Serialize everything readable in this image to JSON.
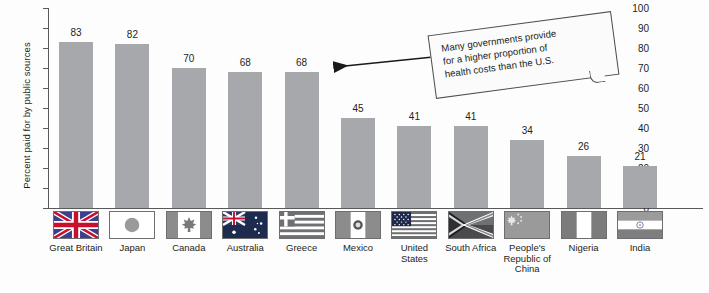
{
  "chart_data": {
    "type": "bar",
    "title": "",
    "xlabel": "",
    "ylabel": "Percent paid for by public sources",
    "ylim": [
      0,
      100
    ],
    "ytick_step": 10,
    "yticks": [
      100,
      90,
      80,
      70,
      60,
      50,
      40,
      30,
      20,
      10,
      0
    ],
    "grid": false,
    "legend": "none",
    "bar_color": "#a6a8ab",
    "axis_color": "#58595b",
    "categories": [
      "Great Britain",
      "Japan",
      "Canada",
      "Australia",
      "Greece",
      "Mexico",
      "United States",
      "South Africa",
      "People's Republic of China",
      "Nigeria",
      "India"
    ],
    "values": [
      83,
      82,
      70,
      68,
      68,
      45,
      41,
      41,
      34,
      26,
      21
    ],
    "annotations": [
      {
        "text": "Many governments provide for a higher proportion of health costs than the U.S.",
        "type": "callout-box-with-arrow",
        "arrow_points_to": "Greece"
      }
    ]
  },
  "axis": {
    "y_title": "Percent paid for by public sources",
    "tick_labels": [
      "100",
      "90",
      "80",
      "70",
      "60",
      "50",
      "40",
      "30",
      "20",
      "10",
      "0"
    ]
  },
  "bars": [
    {
      "label": "Great Britain",
      "value": 83,
      "value_text": "83",
      "flag": "flag-great-britain"
    },
    {
      "label": "Japan",
      "value": 82,
      "value_text": "82",
      "flag": "flag-japan"
    },
    {
      "label": "Canada",
      "value": 70,
      "value_text": "70",
      "flag": "flag-canada"
    },
    {
      "label": "Australia",
      "value": 68,
      "value_text": "68",
      "flag": "flag-australia"
    },
    {
      "label": "Greece",
      "value": 68,
      "value_text": "68",
      "flag": "flag-greece"
    },
    {
      "label": "Mexico",
      "value": 45,
      "value_text": "45",
      "flag": "flag-mexico"
    },
    {
      "label": "United States",
      "value": 41,
      "value_text": "41",
      "flag": "flag-united-states"
    },
    {
      "label": "South Africa",
      "value": 41,
      "value_text": "41",
      "flag": "flag-south-africa"
    },
    {
      "label": "People's Republic of China",
      "value": 34,
      "value_text": "34",
      "flag": "flag-china"
    },
    {
      "label": "Nigeria",
      "value": 26,
      "value_text": "26",
      "flag": "flag-nigeria"
    },
    {
      "label": "India",
      "value": 21,
      "value_text": "21",
      "flag": "flag-india"
    }
  ],
  "callout": {
    "line1": "Many governments provide",
    "line2": "for a higher proportion of",
    "line3": "health costs than the U.S."
  },
  "colors": {
    "bar": "#a6a8ab",
    "axis": "#58595b",
    "text": "#231f20",
    "background": "#fdfdfd",
    "callout_border": "#4d4d4f"
  }
}
